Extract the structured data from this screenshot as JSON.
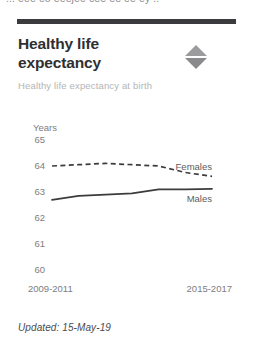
{
  "clipped_header_text": "... eee eo eeejee cee ee ee ey ..",
  "card": {
    "title": "Healthy life expectancy",
    "subtitle": "Healthy life expectancy at birth",
    "sort_icon": "sort-diamond-icon",
    "updated": "Updated: 15-May-19"
  },
  "chart_data": {
    "type": "line",
    "title": "Healthy life expectancy",
    "subtitle": "Healthy life expectancy at birth",
    "xlabel": "",
    "ylabel": "Years",
    "ylim": [
      60,
      65
    ],
    "yticks": [
      65,
      64,
      63,
      62,
      61,
      60
    ],
    "ytick_labels": [
      "65",
      "64",
      "63",
      "62",
      "61",
      "60"
    ],
    "grid": false,
    "legend_position": "inline-right",
    "x": [
      "2009-2011",
      "2010-2012",
      "2011-2013",
      "2012-2014",
      "2013-2015",
      "2014-2016",
      "2015-2017"
    ],
    "xtick_labels": [
      "2009-2011",
      "2015-2017"
    ],
    "series": [
      {
        "name": "Females",
        "style": "dashed",
        "color": "#3c3c3e",
        "values": [
          64.0,
          64.05,
          64.1,
          64.05,
          64.0,
          63.75,
          63.6
        ]
      },
      {
        "name": "Males",
        "style": "solid",
        "color": "#3c3c3e",
        "values": [
          62.7,
          62.85,
          62.9,
          62.95,
          63.1,
          63.1,
          63.12
        ]
      }
    ]
  }
}
